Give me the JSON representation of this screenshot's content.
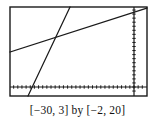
{
  "figure": {
    "kind": "graphing-calculator-viewing-window",
    "caption": "[−30, 3] by [−2, 20]",
    "background_color": "#ffffff",
    "ink_color": "#1a1a1a"
  },
  "caption_parts": {
    "x_window": "[−30, 3]",
    "connector": "by",
    "y_window": "[−2, 20]"
  },
  "chart_data": {
    "type": "line",
    "title": "",
    "subtitle": "",
    "xlabel": "",
    "ylabel": "",
    "xlim": [
      -30,
      3
    ],
    "ylim": [
      -2,
      20
    ],
    "grid": false,
    "legend": "none",
    "axes": {
      "x_axis_at_y": 0,
      "y_axis_at_x": 0,
      "x_tick_spacing": 1,
      "y_tick_spacing": 1,
      "tick_marks": true,
      "axis_labels_shown": false,
      "border_box": true
    },
    "series": [
      {
        "name": "shallow-line",
        "style": "solid",
        "slope": 0.4242,
        "intercept": 19.0,
        "x": [
          -30,
          3
        ],
        "y": [
          6.27,
          20.27
        ],
        "points": [
          {
            "x": -30,
            "y": 6.3
          },
          {
            "x": -15.9,
            "y": 12.2
          },
          {
            "x": 0,
            "y": 19.0
          },
          {
            "x": 3,
            "y": 20.3
          }
        ]
      },
      {
        "name": "steep-line",
        "style": "solid",
        "slope": 2.41,
        "intercept": 49.3,
        "x": [
          -22.3,
          -15.6
        ],
        "y": [
          -4.4,
          11.9
        ],
        "points": [
          {
            "x": -21.9,
            "y": -2.0
          },
          {
            "x": -20.5,
            "y": 1.4
          },
          {
            "x": -15.6,
            "y": 13.3
          }
        ]
      }
    ],
    "intersection": {
      "x": -18.7,
      "y": 11.1
    },
    "annotations": []
  },
  "geometry_px": {
    "box": {
      "left": 10,
      "top": 7,
      "right": 147,
      "bottom": 96
    },
    "x_axis_y": 87,
    "y_axis_x": 134,
    "shallow_line": {
      "x1": 10,
      "y1": 52,
      "x2": 147,
      "y2": 8
    },
    "steep_line": {
      "x1": 28,
      "y1": 96,
      "x2": 70,
      "y2": 7
    },
    "intersection": {
      "x": 57,
      "y": 41
    },
    "x_tick_step": 4.15,
    "y_tick_step": 4.05
  }
}
